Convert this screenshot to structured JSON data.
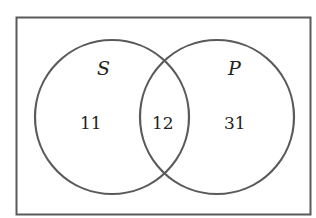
{
  "diagram": {
    "type": "venn",
    "sets": [
      {
        "name": "S",
        "only_count": "11"
      },
      {
        "name": "P",
        "only_count": "31"
      }
    ],
    "intersection_count": "12",
    "colors": {
      "stroke": "#5a5a5a",
      "text": "#222222",
      "background": "#ffffff"
    }
  }
}
